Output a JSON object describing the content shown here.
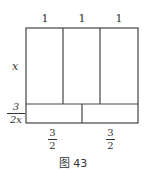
{
  "diagram": {
    "top_labels": [
      "1",
      "1",
      "1"
    ],
    "side_label": "x",
    "bottom_left_side": {
      "numerator": "3",
      "denominator": "2x"
    },
    "bottom_labels": [
      {
        "numerator": "3",
        "denominator": "2"
      },
      {
        "numerator": "3",
        "denominator": "2"
      }
    ],
    "caption": "图 43",
    "line_color": "#444444"
  }
}
